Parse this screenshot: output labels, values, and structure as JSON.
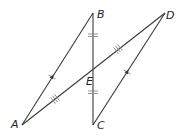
{
  "diagram": {
    "type": "geometry",
    "points": {
      "A": {
        "label": "A",
        "x": 22,
        "y": 125
      },
      "B": {
        "label": "B",
        "x": 93,
        "y": 13
      },
      "C": {
        "label": "C",
        "x": 93,
        "y": 125
      },
      "D": {
        "label": "D",
        "x": 165,
        "y": 13
      },
      "E": {
        "label": "E",
        "x": 93,
        "y": 69
      }
    },
    "segments": [
      "AB",
      "BC",
      "CD",
      "AD"
    ],
    "markings": {
      "BE_CE": "double tick (congruent)",
      "AE_DE": "triple tick (congruent)",
      "AB_CD": "single tick with parallel arrow"
    }
  }
}
